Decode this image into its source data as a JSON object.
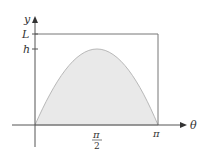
{
  "diagram": {
    "axes": {
      "x_label": "θ",
      "y_label": "y"
    },
    "y_ticks": [
      {
        "label": "L",
        "meaning": "rectangle height"
      },
      {
        "label": "h",
        "meaning": "curve maximum"
      }
    ],
    "x_ticks": [
      {
        "label_num": "π",
        "label_den": "2"
      },
      {
        "label": "π"
      }
    ],
    "curve": "half sine arch from 0 to π with maximum h at π/2",
    "rectangle": "0 ≤ θ ≤ π, 0 ≤ y ≤ L",
    "colors": {
      "fill": "#e9e9e9",
      "curve_stroke": "#b8b8b8",
      "axis": "#555555",
      "rect": "#777777"
    }
  }
}
